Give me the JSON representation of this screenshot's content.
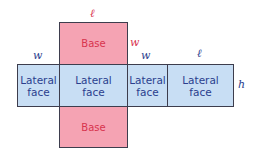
{
  "diagram": {
    "colors": {
      "base_fill": "#f5a3b3",
      "base_text": "#d8344e",
      "lateral_fill": "#c8def4",
      "lateral_text": "#2b3e8e",
      "border": "#3d3d4d"
    },
    "top_base": {
      "label": "Base"
    },
    "bottom_base": {
      "label": "Base"
    },
    "lateral_faces": [
      {
        "label_line1": "Lateral",
        "label_line2": "face"
      },
      {
        "label_line1": "Lateral",
        "label_line2": "face"
      },
      {
        "label_line1": "Lateral",
        "label_line2": "face"
      },
      {
        "label_line1": "Lateral",
        "label_line2": "face"
      }
    ],
    "dimension_labels": {
      "top_length": "ℓ",
      "base_width": "w",
      "face1_width": "w",
      "face3_width": "w",
      "face4_length": "ℓ",
      "height": "h"
    }
  }
}
